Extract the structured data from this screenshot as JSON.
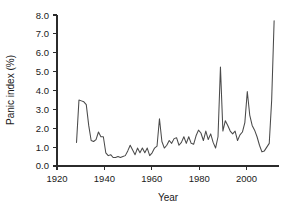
{
  "chart_data": {
    "type": "line",
    "title": "",
    "xlabel": "Year",
    "ylabel": "Panic index (%)",
    "xlim": [
      1920,
      2011
    ],
    "ylim": [
      0.0,
      8.0
    ],
    "grid": false,
    "legend": false,
    "legend_position": "none",
    "line_color": "#4a4a4a",
    "axis_color": "#2b2b2b",
    "background_color": "#ffffff",
    "x_ticks": [
      1920,
      1940,
      1960,
      1980,
      2000
    ],
    "x_tick_labels": [
      "1920",
      "1940",
      "1960",
      "1980",
      "2000"
    ],
    "y_ticks": [
      0.0,
      1.0,
      2.0,
      3.0,
      4.0,
      5.0,
      6.0,
      7.0,
      8.0
    ],
    "y_tick_labels": [
      "0.0",
      "1.0",
      "2.0",
      "3.0",
      "4.0",
      "5.0",
      "6.0",
      "7.0",
      "8.0"
    ],
    "series": [
      {
        "name": "Panic index",
        "x": [
          1928,
          1929,
          1930,
          1931,
          1932,
          1933,
          1934,
          1935,
          1936,
          1937,
          1938,
          1939,
          1940,
          1941,
          1942,
          1943,
          1944,
          1945,
          1946,
          1947,
          1948,
          1949,
          1950,
          1951,
          1952,
          1953,
          1954,
          1955,
          1956,
          1957,
          1958,
          1959,
          1960,
          1961,
          1962,
          1963,
          1964,
          1965,
          1966,
          1967,
          1968,
          1969,
          1970,
          1971,
          1972,
          1973,
          1974,
          1975,
          1976,
          1977,
          1978,
          1979,
          1980,
          1981,
          1982,
          1983,
          1984,
          1985,
          1986,
          1987,
          1988,
          1989,
          1990,
          1991,
          1992,
          1993,
          1994,
          1995,
          1996,
          1997,
          1998,
          1999,
          2000,
          2001,
          2002,
          2003,
          2004,
          2005,
          2006,
          2007,
          2008,
          2009
        ],
        "values": [
          1.25,
          3.5,
          3.45,
          3.4,
          3.25,
          2.15,
          1.35,
          1.3,
          1.4,
          1.8,
          1.55,
          1.55,
          0.7,
          0.55,
          0.6,
          0.45,
          0.45,
          0.5,
          0.45,
          0.5,
          0.55,
          0.8,
          1.1,
          0.85,
          0.6,
          0.95,
          0.7,
          0.95,
          0.7,
          0.95,
          0.55,
          0.7,
          0.95,
          1.05,
          2.5,
          1.3,
          0.95,
          1.1,
          1.35,
          1.2,
          1.45,
          1.5,
          1.1,
          1.25,
          1.55,
          1.2,
          1.55,
          1.2,
          1.15,
          1.6,
          1.9,
          1.75,
          1.35,
          1.85,
          1.4,
          1.7,
          1.25,
          0.95,
          1.55,
          5.25,
          1.85,
          2.4,
          2.15,
          1.85,
          1.7,
          1.85,
          1.35,
          1.65,
          1.8,
          2.3,
          3.95,
          2.7,
          2.15,
          1.9,
          1.55,
          1.1,
          0.75,
          0.8,
          1.0,
          1.2,
          3.5,
          7.7
        ]
      }
    ],
    "annotations": []
  }
}
